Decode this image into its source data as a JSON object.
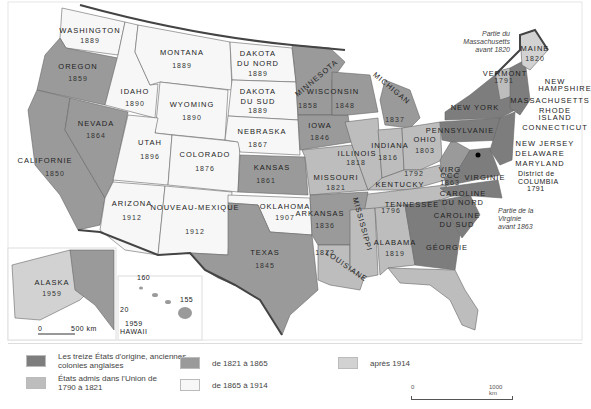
{
  "map_title": "États-Unis : formation territoriale",
  "colors": {
    "original13": "#7d7d7d",
    "from1790to1821": "#bdbdbd",
    "from1821to1865": "#9a9a9a",
    "from1865to1914": "#f7f7f7",
    "after1914": "#d2d2d2",
    "border": "#444444"
  },
  "states": [
    {
      "name": "WASHINGTON",
      "year": "1889"
    },
    {
      "name": "OREGON",
      "year": "1859"
    },
    {
      "name": "CALIFORNIE",
      "year": "1850"
    },
    {
      "name": "NEVADA",
      "year": "1864"
    },
    {
      "name": "IDAHO",
      "year": "1890"
    },
    {
      "name": "MONTANA",
      "year": "1889"
    },
    {
      "name": "WYOMING",
      "year": "1890"
    },
    {
      "name": "UTAH",
      "year": "1896"
    },
    {
      "name": "COLORADO",
      "year": "1876"
    },
    {
      "name": "ARIZONA",
      "year": "1912"
    },
    {
      "name": "NOUVEAU-MEXIQUE",
      "year": "1912"
    },
    {
      "name": "DAKOTA DU NORD",
      "year": "1889"
    },
    {
      "name": "DAKOTA DU SUD",
      "year": "1889"
    },
    {
      "name": "NEBRASKA",
      "year": "1867"
    },
    {
      "name": "KANSAS",
      "year": "1861"
    },
    {
      "name": "OKLAHOMA",
      "year": "1907"
    },
    {
      "name": "TEXAS",
      "year": "1845"
    },
    {
      "name": "MINNESOTA",
      "year": "1858"
    },
    {
      "name": "IOWA",
      "year": "1846"
    },
    {
      "name": "MISSOURI",
      "year": "1821"
    },
    {
      "name": "ARKANSAS",
      "year": "1836"
    },
    {
      "name": "LOUISIANE",
      "year": "1812"
    },
    {
      "name": "WISCONSIN",
      "year": "1848"
    },
    {
      "name": "MICHIGAN",
      "year": "1837"
    },
    {
      "name": "ILLINOIS",
      "year": "1818"
    },
    {
      "name": "INDIANA",
      "year": "1816"
    },
    {
      "name": "OHIO",
      "year": "1803"
    },
    {
      "name": "KENTUCKY",
      "year": "1792"
    },
    {
      "name": "TENNESSEE",
      "year": "1796"
    },
    {
      "name": "MISSISSIPPI",
      "year": "1817"
    },
    {
      "name": "ALABAMA",
      "year": "1819"
    },
    {
      "name": "GÉORGIE",
      "year": ""
    },
    {
      "name": "FLORIDE",
      "year": "1845"
    },
    {
      "name": "CAROLINE DU SUD",
      "year": ""
    },
    {
      "name": "CAROLINE DU NORD",
      "year": ""
    },
    {
      "name": "VIRGINIE",
      "year": ""
    },
    {
      "name": "VIRG OCC",
      "year": "1863"
    },
    {
      "name": "PENNSYLVANIE",
      "year": ""
    },
    {
      "name": "NEW YORK",
      "year": ""
    },
    {
      "name": "VERMONT",
      "year": "1791"
    },
    {
      "name": "MAINE",
      "year": "1820"
    },
    {
      "name": "ALASKA",
      "year": "1959"
    },
    {
      "name": "HAWAII",
      "year": "1959"
    }
  ],
  "east_labels": [
    "NEW HAMPSHIRE",
    "MASSACHUSETTS",
    "RHODE ISLAND",
    "CONNECTICUT",
    "NEW JERSEY",
    "DELAWARE",
    "MARYLAND",
    "District de COLUMBIA 1791"
  ],
  "notes": {
    "maine": "Partie du Massachusetts avant 1820",
    "wv": "Partie de la Virginie avant 1863"
  },
  "inset": {
    "alaska_scale_0": "0",
    "alaska_scale_end": "500 km",
    "hawaii_lon": "160",
    "hawaii_lon2": "155",
    "hawaii_lat": "20"
  },
  "legend": [
    {
      "label": "Les treize États d'origine, anciennes colonies anglaises",
      "color": "#7d7d7d"
    },
    {
      "label": "États admis dans l'Union de 1790 à 1821",
      "color": "#bdbdbd"
    },
    {
      "label": "de 1821 à 1865",
      "color": "#9a9a9a"
    },
    {
      "label": "de 1865 à 1914",
      "color": "#f7f7f7"
    },
    {
      "label": "après 1914",
      "color": "#d2d2d2"
    }
  ],
  "scale": {
    "start": "0",
    "end": "1000 km"
  }
}
